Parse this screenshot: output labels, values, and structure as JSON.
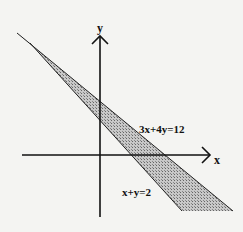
{
  "diagram": {
    "axes": {
      "x_label": "x",
      "y_label": "y"
    },
    "lines": [
      {
        "id": "upper",
        "equation": "3x+4y=12"
      },
      {
        "id": "lower",
        "equation": "x+y=2"
      }
    ],
    "shaded_region": "region between x+y=2 and 3x+4y=12",
    "colors": {
      "background": "#f4f4f2",
      "line": "#111111",
      "shade": "#9a9a9a"
    }
  }
}
